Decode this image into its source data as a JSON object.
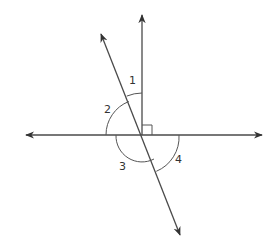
{
  "diagram": {
    "title": "",
    "type": "intersecting lines with angles",
    "colors": {
      "line": "#4a4a4a",
      "arc": "#555555",
      "text": "#333333",
      "background": "#ffffff"
    },
    "angles": [
      {
        "id": "1",
        "label": "1"
      },
      {
        "id": "2",
        "label": "2"
      },
      {
        "id": "3",
        "label": "3"
      },
      {
        "id": "4",
        "label": "4"
      }
    ],
    "right_angle_marker": true,
    "elements": {
      "horizontal_line": "line (arrows both ends)",
      "vertical_ray": "ray pointing up, perpendicular to horizontal line",
      "transversal": "line (arrows both ends) crossing the intersection"
    }
  }
}
